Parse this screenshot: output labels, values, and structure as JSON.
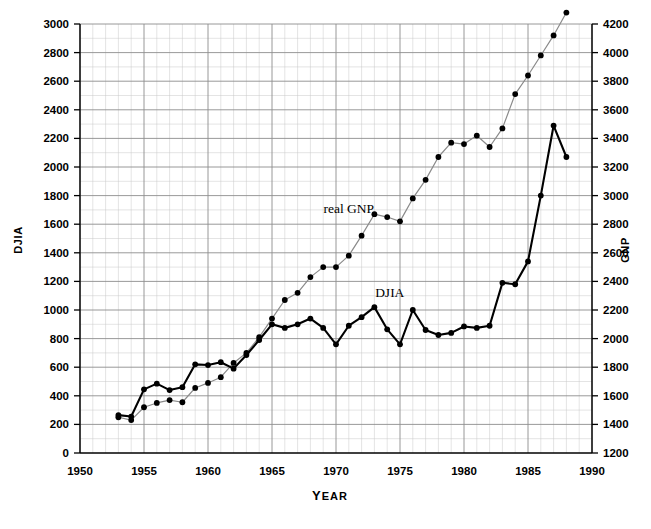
{
  "chart_data": {
    "type": "line",
    "title": "",
    "xlabel": "YEAR",
    "ylabel": "DJIA",
    "y2label": "GNP",
    "xlim": [
      1950,
      1990
    ],
    "ylim": [
      0,
      3000
    ],
    "y2lim": [
      1200,
      4200
    ],
    "grid": true,
    "legend": "inline-annotations",
    "x_ticks": [
      1950,
      1955,
      1960,
      1965,
      1970,
      1975,
      1980,
      1985,
      1990
    ],
    "x_minor_step": 1,
    "y_ticks": [
      0,
      200,
      400,
      600,
      800,
      1000,
      1200,
      1400,
      1600,
      1800,
      2000,
      2200,
      2400,
      2600,
      2800,
      3000
    ],
    "y_minor_step": 100,
    "y2_ticks": [
      1200,
      1400,
      1600,
      1800,
      2000,
      2200,
      2400,
      2600,
      2800,
      3000,
      3200,
      3400,
      3600,
      3800,
      4000,
      4200
    ],
    "y2_minor_step": 100,
    "annotations": [
      {
        "text": "real GNP",
        "x": 1971.0,
        "axis": "right",
        "value": 2880
      },
      {
        "text": "DJIA",
        "x": 1974.2,
        "axis": "left",
        "value": 1090
      }
    ],
    "x": [
      1953,
      1954,
      1955,
      1956,
      1957,
      1958,
      1959,
      1960,
      1961,
      1962,
      1963,
      1964,
      1965,
      1966,
      1967,
      1968,
      1969,
      1970,
      1971,
      1972,
      1973,
      1974,
      1975,
      1976,
      1977,
      1978,
      1979,
      1980,
      1981,
      1982,
      1983,
      1984,
      1985,
      1986,
      1987,
      1988
    ],
    "series": [
      {
        "name": "DJIA",
        "axis": "left",
        "units": "index",
        "color": "#000000",
        "style": "thick-black-line-with-markers",
        "values": [
          265,
          255,
          445,
          485,
          440,
          460,
          620,
          615,
          635,
          590,
          685,
          790,
          900,
          875,
          900,
          940,
          875,
          760,
          890,
          950,
          1020,
          865,
          760,
          1000,
          860,
          825,
          840,
          885,
          875,
          890,
          1190,
          1180,
          1340,
          1800,
          2290,
          2070
        ]
      },
      {
        "name": "real GNP",
        "axis": "right",
        "units": "billions of 1982 dollars",
        "color": "#8a8a8a",
        "style": "thin-gray-line-with-markers",
        "values": [
          1450,
          1430,
          1520,
          1550,
          1570,
          1555,
          1655,
          1690,
          1730,
          1830,
          1900,
          2010,
          2140,
          2270,
          2320,
          2430,
          2500,
          2500,
          2580,
          2720,
          2870,
          2850,
          2820,
          2980,
          3110,
          3270,
          3370,
          3360,
          3420,
          3340,
          3470,
          3710,
          3840,
          3980,
          4120,
          4280
        ]
      }
    ]
  },
  "figure": {
    "background": "#ffffff",
    "grid_minor_color": "#c9c9c9",
    "grid_major_color": "#8d8d8d",
    "axis_color": "#000000"
  }
}
